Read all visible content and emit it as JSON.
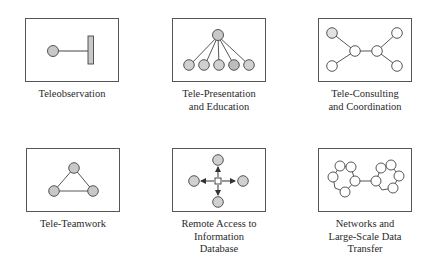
{
  "diagram": {
    "style": {
      "frame_stroke": "#555555",
      "edge_stroke": "#444444",
      "node_fill_gray": "#c8c8c8",
      "node_fill_white": "#ffffff",
      "text_color": "#2a2a2a"
    },
    "panels": [
      {
        "id": "teleobservation",
        "label_lines": [
          "Teleobservation"
        ],
        "description": "single gray node connected by a line to a vertical bar"
      },
      {
        "id": "tele-presentation",
        "label_lines": [
          "Tele-Presentation",
          "and Education"
        ],
        "description": "one gray node at top fanning out to five gray nodes below"
      },
      {
        "id": "tele-consulting",
        "label_lines": [
          "Tele-Consulting",
          "and Coordination"
        ],
        "description": "two linked central nodes each with two outer nodes (butterfly)"
      },
      {
        "id": "tele-teamwork",
        "label_lines": [
          "Tele-Teamwork"
        ],
        "description": "three gray nodes connected in a triangle"
      },
      {
        "id": "remote-access",
        "label_lines": [
          "Remote Access to",
          "Information",
          "Database"
        ],
        "description": "central square hub with arrows pointing to four gray nodes"
      },
      {
        "id": "networks",
        "label_lines": [
          "Networks and",
          "Large-Scale Data",
          "Transfer"
        ],
        "description": "two rings of six white nodes joined by a single link"
      }
    ]
  }
}
